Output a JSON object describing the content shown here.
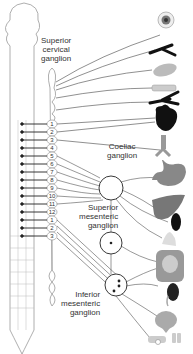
{
  "labels": {
    "superior_cervical": [
      "Superior",
      "cervical",
      "ganglion"
    ],
    "coeliac": [
      "Coeliac",
      "ganglion"
    ],
    "superior_mesenteric": [
      "Superior",
      "mesenteric",
      "ganglion"
    ],
    "inferior_mesenteric": [
      "Inferior",
      "mesenteric",
      "ganglion"
    ]
  },
  "thoracic_segments": [
    "1",
    "2",
    "3",
    "4",
    "5",
    "6",
    "7",
    "8",
    "9",
    "10",
    "11",
    "12"
  ],
  "lumbar_segments": [
    "1",
    "2",
    "3"
  ],
  "organs": [
    {
      "name": "eye",
      "y": 22
    },
    {
      "name": "lacrimal-gland",
      "y": 50
    },
    {
      "name": "salivary-gland",
      "y": 70
    },
    {
      "name": "parotid-gland",
      "y": 88
    },
    {
      "name": "airway-vessels",
      "y": 102
    },
    {
      "name": "heart",
      "y": 118
    },
    {
      "name": "trachea-lungs",
      "y": 148
    },
    {
      "name": "stomach",
      "y": 177
    },
    {
      "name": "liver",
      "y": 210
    },
    {
      "name": "spleen",
      "y": 222
    },
    {
      "name": "pancreas",
      "y": 240
    },
    {
      "name": "small-intestine",
      "y": 265
    },
    {
      "name": "kidney-adrenal",
      "y": 290
    },
    {
      "name": "bladder",
      "y": 318
    },
    {
      "name": "genitalia",
      "y": 340
    }
  ],
  "colors": {
    "line": "#333333",
    "organ_dark": "#111111",
    "organ_grey": "#8a8a8a",
    "organ_light": "#cfcfcf"
  }
}
